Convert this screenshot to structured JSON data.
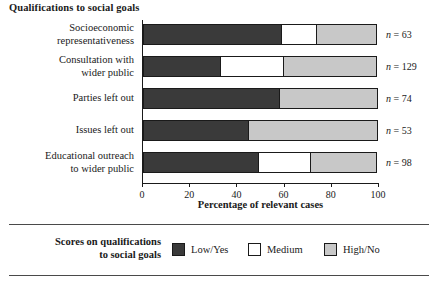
{
  "chart_data": {
    "type": "bar",
    "orientation": "horizontal",
    "stacked": true,
    "title": "Qualifications to social goals",
    "xlabel": "Percentage of relevant cases",
    "ylabel": "",
    "xlim": [
      0,
      100
    ],
    "xticks": [
      0,
      20,
      40,
      60,
      80,
      100
    ],
    "xtick_labels": [
      "0",
      "20",
      "40",
      "60",
      "80",
      "100"
    ],
    "grid": false,
    "legend_position": "bottom",
    "categories": [
      "Socioeconomic representativeness",
      "Consultation with wider public",
      "Parties left out",
      "Issues left out",
      "Educational outreach to wider public"
    ],
    "series": [
      {
        "name": "Low/Yes",
        "color": "#3a3a3a",
        "values": [
          59,
          33,
          58,
          45,
          49
        ]
      },
      {
        "name": "Medium",
        "color": "#ffffff",
        "values": [
          15,
          27,
          0,
          0,
          22.5
        ]
      },
      {
        "name": "High/No",
        "color": "#c8c8c8",
        "values": [
          26,
          40,
          42,
          55,
          28.5
        ]
      }
    ],
    "annotations": [
      "n = 63",
      "n = 129",
      "n = 74",
      "n = 53",
      "n = 98"
    ]
  },
  "chart": {
    "title": "Qualifications to social goals",
    "x_axis_title": "Percentage of relevant cases",
    "rows": [
      {
        "label_line1": "Socioeconomic",
        "label_line2": "representativeness",
        "n_prefix": "n",
        "n_value": "= 63",
        "low": 59,
        "medium": 15,
        "high": 26
      },
      {
        "label_line1": "Consultation with",
        "label_line2": "wider public",
        "n_prefix": "n",
        "n_value": "= 129",
        "low": 33,
        "medium": 27,
        "high": 40
      },
      {
        "label_line1": "Parties left out",
        "label_line2": "",
        "n_prefix": "n",
        "n_value": "= 74",
        "low": 58,
        "medium": 0,
        "high": 42
      },
      {
        "label_line1": "Issues left out",
        "label_line2": "",
        "n_prefix": "n",
        "n_value": "= 53",
        "low": 45,
        "medium": 0,
        "high": 55
      },
      {
        "label_line1": "Educational outreach",
        "label_line2": "to wider public",
        "n_prefix": "n",
        "n_value": "= 98",
        "low": 49,
        "medium": 22.5,
        "high": 28.5
      }
    ],
    "ticks": [
      "0",
      "20",
      "40",
      "60",
      "80",
      "100"
    ]
  },
  "legend": {
    "title_line1": "Scores on qualifications",
    "title_line2": "to social goals",
    "entries": [
      {
        "label": "Low/Yes",
        "color": "#3a3a3a"
      },
      {
        "label": "Medium",
        "color": "#ffffff"
      },
      {
        "label": "High/No",
        "color": "#c8c8c8"
      }
    ]
  }
}
